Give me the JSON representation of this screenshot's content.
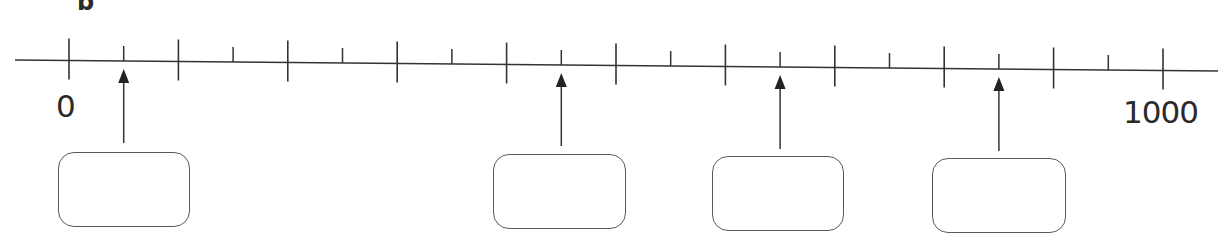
{
  "question": {
    "part_label": "b"
  },
  "number_line": {
    "start_label": "0",
    "end_label": "1000",
    "min": 0,
    "max": 1000,
    "major_step": 100,
    "minor_step": 50,
    "major_tick_values": [
      0,
      100,
      200,
      300,
      400,
      500,
      600,
      700,
      800,
      900,
      1000
    ],
    "minor_tick_values": [
      50,
      150,
      250,
      350,
      450,
      550,
      650,
      750,
      850,
      950
    ]
  },
  "arrows": [
    {
      "points_to_value": 50
    },
    {
      "points_to_value": 450
    },
    {
      "points_to_value": 650
    },
    {
      "points_to_value": 850
    }
  ],
  "answer_boxes": [
    {
      "value": ""
    },
    {
      "value": ""
    },
    {
      "value": ""
    },
    {
      "value": ""
    }
  ],
  "colors": {
    "ink": "#333333",
    "box_border": "#5a5a5a",
    "background": "#ffffff"
  }
}
